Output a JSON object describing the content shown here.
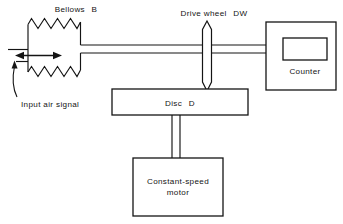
{
  "figure": {
    "title": "Pneumatic integrator / air-signal counter schematic",
    "background_color": "#ffffff",
    "line_color": "#141414",
    "width": 343,
    "height": 224
  },
  "labels": {
    "bellows": "Bellows",
    "bellows_symbol": "B",
    "drive_wheel": "Drive wheel",
    "drive_wheel_symbol": "DW",
    "counter": "Counter",
    "disc": "Disc",
    "disc_symbol": "D",
    "motor_line1": "Constant-speed",
    "motor_line2": "motor",
    "input_air_signal": "Input air signal"
  },
  "components": [
    {
      "name": "bellows",
      "kind": "spring-bellows",
      "label": "Bellows B"
    },
    {
      "name": "drive-wheel",
      "kind": "hexagon-wheel",
      "label": "Drive wheel DW"
    },
    {
      "name": "counter",
      "kind": "box-with-display",
      "label": "Counter"
    },
    {
      "name": "disc",
      "kind": "box",
      "label": "Disc D"
    },
    {
      "name": "motor",
      "kind": "box",
      "label": "Constant-speed motor"
    }
  ],
  "connections": [
    {
      "name": "bellows-to-drive-wheel-shaft",
      "from": "bellows",
      "to": "drive-wheel",
      "style": "double-line-rod"
    },
    {
      "name": "drive-wheel-to-counter-shaft",
      "from": "drive-wheel",
      "to": "counter",
      "style": "double-line-rod"
    },
    {
      "name": "drive-wheel-to-disc-contact",
      "from": "drive-wheel",
      "to": "disc",
      "style": "contact"
    },
    {
      "name": "disc-to-motor-shaft",
      "from": "disc",
      "to": "motor",
      "style": "double-line-rod"
    }
  ],
  "annotations": [
    {
      "name": "displacement-arrow",
      "kind": "double-headed-arrow",
      "orientation": "horizontal"
    },
    {
      "name": "input-air-signal-leader",
      "kind": "curved-leader-with-arrow",
      "points_to": "bellows-inlet"
    }
  ]
}
